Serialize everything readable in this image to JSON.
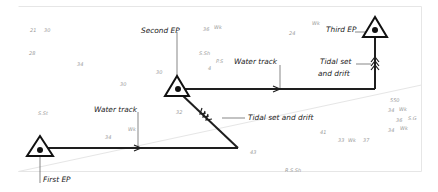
{
  "diagram": {
    "labels": {
      "first_ep": "First EP",
      "second_ep": "Second EP",
      "third_ep": "Third EP",
      "water_track_1": "Water track",
      "water_track_2": "Water track",
      "tidal_1": "Tidal set and drift",
      "tidal_2_line1": "Tidal set",
      "tidal_2_line2": "and drift"
    },
    "soundings": [
      {
        "text": "21"
      },
      {
        "text": "30"
      },
      {
        "text": "28"
      },
      {
        "text": "34"
      },
      {
        "text": "30"
      },
      {
        "text": "30"
      },
      {
        "text": "36"
      },
      {
        "text": "Wk"
      },
      {
        "text": "S.Sh"
      },
      {
        "text": "P.S"
      },
      {
        "text": "4"
      },
      {
        "text": "24"
      },
      {
        "text": "Wk"
      },
      {
        "text": "S.St"
      },
      {
        "text": "Wk"
      },
      {
        "text": "34"
      },
      {
        "text": "32"
      },
      {
        "text": "43"
      },
      {
        "text": "41"
      },
      {
        "text": "33"
      },
      {
        "text": "Wk"
      },
      {
        "text": "37"
      },
      {
        "text": "R.S.Sh"
      },
      {
        "text": "550"
      },
      {
        "text": "34"
      },
      {
        "text": "Wk"
      },
      {
        "text": "36"
      },
      {
        "text": "S.G"
      },
      {
        "text": "34"
      },
      {
        "text": "Wk"
      }
    ],
    "icons": {
      "ep_symbol": "triangle-with-dot",
      "water_track_arrow": "single-chevron-arrow",
      "tidal_arrow": "triple-chevron-arrow"
    }
  }
}
